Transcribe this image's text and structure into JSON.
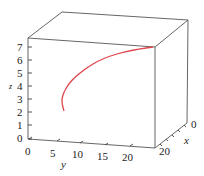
{
  "chart_data": {
    "type": "line3d",
    "title": "",
    "xlabel": "x",
    "ylabel": "y",
    "zlabel": "z",
    "x_ticks": [
      0,
      20
    ],
    "y_ticks": [
      0,
      5,
      10,
      15,
      20
    ],
    "z_ticks": [
      0,
      1,
      2,
      3,
      4,
      5,
      6,
      7
    ],
    "xlim": [
      0,
      20
    ],
    "ylim": [
      0,
      20
    ],
    "zlim": [
      0,
      7
    ],
    "grid": false,
    "legend": null,
    "series": [
      {
        "name": "space curve",
        "color": "#e0464b",
        "points_screen": [
          [
            64,
            111
          ],
          [
            62,
            104
          ],
          [
            62,
            98
          ],
          [
            64,
            92
          ],
          [
            68,
            85
          ],
          [
            73,
            79
          ],
          [
            80,
            73
          ],
          [
            88,
            67
          ],
          [
            98,
            61
          ],
          [
            110,
            56
          ],
          [
            124,
            52
          ],
          [
            139,
            49
          ],
          [
            153,
            47
          ]
        ]
      }
    ]
  },
  "labels": {
    "x": "x",
    "y": "y",
    "z": "z",
    "x_ticks": [
      "0",
      "20"
    ],
    "y_ticks": [
      "0",
      "5",
      "10",
      "15",
      "20"
    ],
    "z_ticks": [
      "0",
      "1",
      "2",
      "3",
      "4",
      "5",
      "6",
      "7"
    ]
  },
  "colors": {
    "curve": "#e0464b",
    "box": "#555555"
  }
}
